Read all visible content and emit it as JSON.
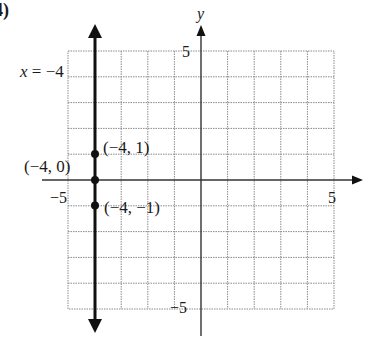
{
  "problem_label": "4)",
  "graph": {
    "x_range": [
      -5,
      5
    ],
    "y_range": [
      -5,
      5
    ],
    "axis_labels": {
      "x": "",
      "y": "y"
    },
    "tick_labels": {
      "x_neg": "−5",
      "x_pos": "5",
      "y_pos": "5",
      "y_neg": "−5"
    },
    "line": {
      "equation_label": "x = −4",
      "x_value": -4,
      "color": "#111111"
    },
    "points": [
      {
        "x": -4,
        "y": 1,
        "label": "(−4, 1)"
      },
      {
        "x": -4,
        "y": 0,
        "label": "(−4, 0)"
      },
      {
        "x": -4,
        "y": -1,
        "label": "(−4, −1)"
      }
    ],
    "colors": {
      "grid": "#8a8a8a",
      "axis": "#333333",
      "line": "#111111"
    }
  }
}
